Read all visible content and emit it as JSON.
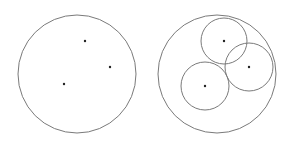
{
  "diagram": {
    "width": 291,
    "height": 147,
    "stroke_color": "#7a7a7a",
    "dot_color": "#222222",
    "panels": [
      {
        "name": "points-only",
        "outer_circle": {
          "cx": 77,
          "cy": 74,
          "r": 59
        },
        "points": [
          {
            "x": 85,
            "y": 41
          },
          {
            "x": 110,
            "y": 67
          },
          {
            "x": 64,
            "y": 84
          }
        ],
        "inner_circles": []
      },
      {
        "name": "points-with-circles",
        "outer_circle": {
          "cx": 217,
          "cy": 74,
          "r": 59
        },
        "points": [
          {
            "x": 224,
            "y": 41
          },
          {
            "x": 249,
            "y": 67
          },
          {
            "x": 205,
            "y": 86
          }
        ],
        "inner_circles": [
          {
            "cx": 224,
            "cy": 41,
            "r": 23
          },
          {
            "cx": 249,
            "cy": 67,
            "r": 24
          },
          {
            "cx": 205,
            "cy": 86,
            "r": 24
          }
        ]
      }
    ]
  }
}
